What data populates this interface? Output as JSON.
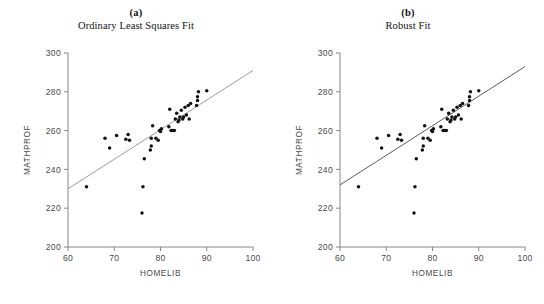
{
  "figure": {
    "background": "#ffffff",
    "point_color": "#111111",
    "axis_color": "#7a7a7a",
    "ols_line_color": "#8a8a8a",
    "robust_line_color": "#4a4a4a"
  },
  "panels": [
    {
      "letter": "(a)",
      "subtitle": "Ordinary Least Squares Fit",
      "ylabel": "MATHPROF",
      "xlabel": "HOMELIB"
    },
    {
      "letter": "(b)",
      "subtitle": "Robust Fit",
      "ylabel": "MATHPROF",
      "xlabel": "HOMELIB"
    }
  ],
  "chart_data": [
    {
      "type": "scatter",
      "title": "Ordinary Least Squares Fit",
      "panel_letter": "(a)",
      "xlabel": "HOMELIB",
      "ylabel": "MATHPROF",
      "xlim": [
        60,
        100
      ],
      "ylim": [
        200,
        300
      ],
      "xticks": [
        60,
        70,
        80,
        90,
        100
      ],
      "yticks": [
        200,
        220,
        240,
        260,
        280,
        300
      ],
      "grid": false,
      "legend": "none",
      "points": [
        [
          64.0,
          231.0
        ],
        [
          68.0,
          256.0
        ],
        [
          69.0,
          251.0
        ],
        [
          70.5,
          257.5
        ],
        [
          72.5,
          255.5
        ],
        [
          73.0,
          258.0
        ],
        [
          73.3,
          255.0
        ],
        [
          76.0,
          217.5
        ],
        [
          76.2,
          231.0
        ],
        [
          76.5,
          245.5
        ],
        [
          77.8,
          250.0
        ],
        [
          78.0,
          252.0
        ],
        [
          78.0,
          256.0
        ],
        [
          78.3,
          262.5
        ],
        [
          79.0,
          256.0
        ],
        [
          79.5,
          255.0
        ],
        [
          79.8,
          260.0
        ],
        [
          80.0,
          259.5
        ],
        [
          80.2,
          261.0
        ],
        [
          81.8,
          262.0
        ],
        [
          82.0,
          271.0
        ],
        [
          82.3,
          260.0
        ],
        [
          82.6,
          260.0
        ],
        [
          83.0,
          260.0
        ],
        [
          83.2,
          266.0
        ],
        [
          83.5,
          269.0
        ],
        [
          83.8,
          264.5
        ],
        [
          84.0,
          265.5
        ],
        [
          84.2,
          267.0
        ],
        [
          84.5,
          270.5
        ],
        [
          84.8,
          266.0
        ],
        [
          85.0,
          267.0
        ],
        [
          85.3,
          272.0
        ],
        [
          85.6,
          268.0
        ],
        [
          86.0,
          273.0
        ],
        [
          86.2,
          266.0
        ],
        [
          86.5,
          274.0
        ],
        [
          87.8,
          273.0
        ],
        [
          88.0,
          275.5
        ],
        [
          88.0,
          277.5
        ],
        [
          88.2,
          280.0
        ],
        [
          90.0,
          280.5
        ]
      ],
      "fit_line": {
        "name": "Ordinary Least Squares Fit",
        "x": [
          60,
          100
        ],
        "y": [
          230.0,
          291.0
        ]
      }
    },
    {
      "type": "scatter",
      "title": "Robust Fit",
      "panel_letter": "(b)",
      "xlabel": "HOMELIB",
      "ylabel": "MATHPROF",
      "xlim": [
        60,
        100
      ],
      "ylim": [
        200,
        300
      ],
      "xticks": [
        60,
        70,
        80,
        90,
        100
      ],
      "yticks": [
        200,
        220,
        240,
        260,
        280,
        300
      ],
      "grid": false,
      "legend": "none",
      "points": [
        [
          64.0,
          231.0
        ],
        [
          68.0,
          256.0
        ],
        [
          69.0,
          251.0
        ],
        [
          70.5,
          257.5
        ],
        [
          72.5,
          255.5
        ],
        [
          73.0,
          258.0
        ],
        [
          73.3,
          255.0
        ],
        [
          76.0,
          217.5
        ],
        [
          76.2,
          231.0
        ],
        [
          76.5,
          245.5
        ],
        [
          77.8,
          250.0
        ],
        [
          78.0,
          252.0
        ],
        [
          78.0,
          256.0
        ],
        [
          78.3,
          262.5
        ],
        [
          79.0,
          256.0
        ],
        [
          79.5,
          255.0
        ],
        [
          79.8,
          260.0
        ],
        [
          80.0,
          259.5
        ],
        [
          80.2,
          261.0
        ],
        [
          81.8,
          262.0
        ],
        [
          82.0,
          271.0
        ],
        [
          82.3,
          260.0
        ],
        [
          82.6,
          260.0
        ],
        [
          83.0,
          260.0
        ],
        [
          83.2,
          266.0
        ],
        [
          83.5,
          269.0
        ],
        [
          83.8,
          264.5
        ],
        [
          84.0,
          265.5
        ],
        [
          84.2,
          267.0
        ],
        [
          84.5,
          270.5
        ],
        [
          84.8,
          266.0
        ],
        [
          85.0,
          267.0
        ],
        [
          85.3,
          272.0
        ],
        [
          85.6,
          268.0
        ],
        [
          86.0,
          273.0
        ],
        [
          86.2,
          266.0
        ],
        [
          86.5,
          274.0
        ],
        [
          87.8,
          273.0
        ],
        [
          88.0,
          275.5
        ],
        [
          88.0,
          277.5
        ],
        [
          88.2,
          280.0
        ],
        [
          90.0,
          280.5
        ]
      ],
      "fit_line": {
        "name": "Robust Fit",
        "x": [
          60,
          100
        ],
        "y": [
          232.0,
          293.0
        ]
      }
    }
  ]
}
